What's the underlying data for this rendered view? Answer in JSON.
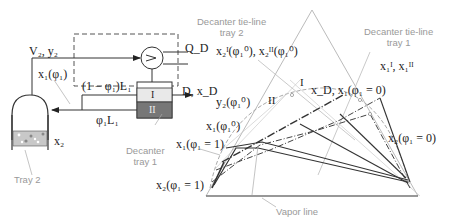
{
  "colors": {
    "line_dark": "#3a3a3a",
    "line_gray": "#b5b5b5",
    "annotation_gray": "#999999",
    "phase_I_fill": "#e9e9e9",
    "phase_II_fill": "#777777",
    "tray_fill": "#c8c8c8"
  },
  "left_schematic": {
    "vapor_stream": "V₂, y₂",
    "condenser_duty": "Q_D",
    "reflux_phase_I": "(1 − φ₁)L₁",
    "reflux_phase_II": "φ₁L₁",
    "distillate": "D, x_D",
    "tray1_liquid": "x₁(φ₁)",
    "tray2_liquid": "x₂",
    "decanter_phase_I": "I",
    "decanter_phase_II": "II",
    "decanter_caption": [
      "Decanter",
      "tray 1"
    ],
    "tray2_caption": "Tray 2"
  },
  "right_diagram": {
    "decanter_tieline_tray2_caption": [
      "Decanter tie-line",
      "tray 2"
    ],
    "decanter_tieline_tray1_caption": [
      "Decanter tie-line",
      "tray 1"
    ],
    "tray2_phase_points": "x₂ᴵ(φ₁⁰), x₂ᴵᴵ(φ₁⁰)",
    "tray1_phase_points": "x₁ᴵ, x₁ᴵᴵ",
    "xD_label": "x_D, x₁(φ₁ = 0)",
    "x2_phi0": "x₂(φ₁ = 0)",
    "y2_phi10": "y₂(φ₁⁰)",
    "x1_phi10": "x₁(φ₁⁰)",
    "x1_phi1": "x₁(φ₁ = 1)",
    "x2_phi1": "x₂(φ₁ = 1)",
    "region_I": "I",
    "region_II": "II",
    "vapor_line_caption": "Vapor line"
  }
}
